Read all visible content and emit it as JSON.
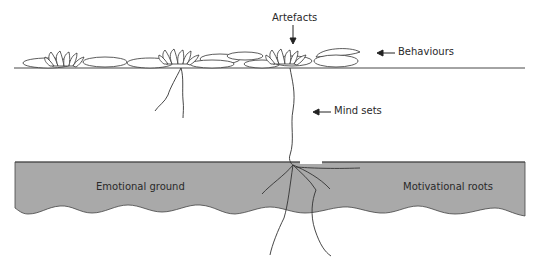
{
  "diagram": {
    "type": "iceberg-style culture metaphor (water lily)",
    "labels": {
      "artefacts": "Artefacts",
      "behaviours": "Behaviours",
      "mind_sets": "Mind sets",
      "emotional_ground": "Emotional ground",
      "motivational_roots": "Motivational roots"
    },
    "colors": {
      "ground": "#a9a9a9",
      "line": "#333333",
      "background": "#ffffff"
    }
  }
}
